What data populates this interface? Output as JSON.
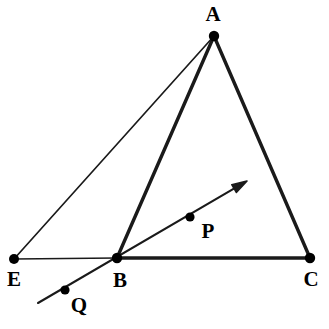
{
  "figure": {
    "width": 329,
    "height": 329,
    "background_color": "#ffffff",
    "stroke_color": "#1a1a1a",
    "vertex_color": "#000000"
  },
  "points": [
    {
      "id": "A",
      "label": "A",
      "x": 214,
      "y": 36,
      "dot_radius": 5.2,
      "label_x": 213,
      "label_y": 14
    },
    {
      "id": "E",
      "label": "E",
      "x": 14,
      "y": 259,
      "dot_radius": 5.0,
      "label_x": 14,
      "label_y": 279
    },
    {
      "id": "B",
      "label": "B",
      "x": 117,
      "y": 258,
      "dot_radius": 5.2,
      "label_x": 120,
      "label_y": 280
    },
    {
      "id": "C",
      "label": "C",
      "x": 310,
      "y": 258,
      "dot_radius": 5.2,
      "label_x": 311,
      "label_y": 279
    },
    {
      "id": "P",
      "label": "P",
      "x": 190,
      "y": 217,
      "dot_radius": 4.6,
      "label_x": 208,
      "label_y": 231
    },
    {
      "id": "Q",
      "label": "Q",
      "x": 65,
      "y": 290,
      "dot_radius": 4.6,
      "label_x": 79,
      "label_y": 305
    }
  ],
  "segments": [
    {
      "id": "AB",
      "from": "A",
      "to": "B",
      "x1": 214,
      "y1": 36,
      "x2": 117,
      "y2": 258,
      "width": 3.4,
      "style": "thick"
    },
    {
      "id": "AC",
      "from": "A",
      "to": "C",
      "x1": 214,
      "y1": 36,
      "x2": 310,
      "y2": 258,
      "width": 3.4,
      "style": "thick"
    },
    {
      "id": "BC",
      "from": "B",
      "to": "C",
      "x1": 117,
      "y1": 258,
      "x2": 310,
      "y2": 258,
      "width": 3.4,
      "style": "thick"
    },
    {
      "id": "EA",
      "from": "E",
      "to": "A",
      "x1": 14,
      "y1": 259,
      "x2": 214,
      "y2": 36,
      "width": 1.7,
      "style": "thin"
    },
    {
      "id": "EB",
      "from": "E",
      "to": "B",
      "x1": 14,
      "y1": 259,
      "x2": 117,
      "y2": 258,
      "width": 1.7,
      "style": "thin"
    }
  ],
  "ray": {
    "id": "ray-QBP",
    "label": "ray through Q, B and P",
    "tail_x": 38,
    "tail_y": 303,
    "tip_x": 247,
    "tip_y": 181,
    "width": 2.1,
    "arrowhead_length": 15,
    "arrowhead_width": 9,
    "passes_through": [
      "Q",
      "B",
      "P"
    ]
  }
}
